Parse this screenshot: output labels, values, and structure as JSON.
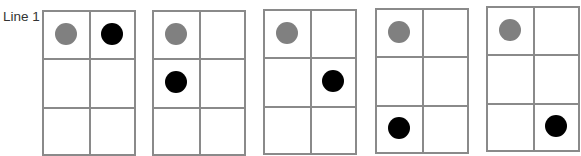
{
  "diagram": {
    "row_label": "Line 1",
    "colors": {
      "grid_line": "#8a8a8a",
      "reference_dot": "#808080",
      "moving_dot": "#000000"
    },
    "grid_size": {
      "rows": 3,
      "cols": 2
    },
    "panels": [
      {
        "index": 1,
        "gray_dot": {
          "row": 1,
          "col": 1
        },
        "black_dot": {
          "row": 1,
          "col": 2
        }
      },
      {
        "index": 2,
        "gray_dot": {
          "row": 1,
          "col": 1
        },
        "black_dot": {
          "row": 2,
          "col": 1
        }
      },
      {
        "index": 3,
        "gray_dot": {
          "row": 1,
          "col": 1
        },
        "black_dot": {
          "row": 2,
          "col": 2
        }
      },
      {
        "index": 4,
        "gray_dot": {
          "row": 1,
          "col": 1
        },
        "black_dot": {
          "row": 3,
          "col": 1
        }
      },
      {
        "index": 5,
        "gray_dot": {
          "row": 1,
          "col": 1
        },
        "black_dot": {
          "row": 3,
          "col": 2
        }
      }
    ]
  }
}
